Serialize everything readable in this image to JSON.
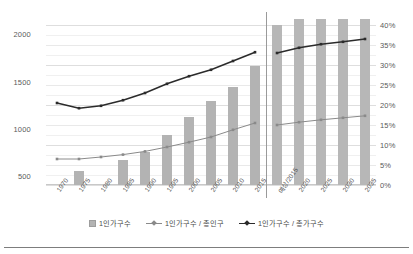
{
  "chart_data": {
    "type": "bar",
    "title": "",
    "subtitle": "",
    "xlabel": "",
    "ylabel": "",
    "y2label": "",
    "grid": true,
    "legend_position": "bottom",
    "panels": [
      {
        "name": "historical",
        "categories": [
          "1970",
          "1975",
          "1980",
          "1985",
          "1990",
          "1995",
          "2000",
          "2005",
          "2010",
          "2015"
        ],
        "series": [
          {
            "name": "1인가구수",
            "type": "bar",
            "axis": "left",
            "values": [
              null,
              548,
              383,
              661,
              750,
              930,
              1120,
              1290,
              1440,
              1670
            ],
            "color": "#b3b3b3"
          },
          {
            "name": "1인가구수 / 총인구",
            "type": "line",
            "axis": "right",
            "values": [
              6.5,
              6.5,
              7.0,
              7.6,
              8.4,
              9.5,
              10.7,
              12.0,
              13.8,
              15.5
            ],
            "color": "#8a8a8a"
          },
          {
            "name": "1인가구수 / 총가구수",
            "type": "line",
            "axis": "right",
            "values": [
              20.5,
              19.2,
              19.8,
              21.2,
              23.0,
              25.3,
              27.2,
              28.8,
              31.0,
              33.2
            ],
            "color": "#2b2b2b"
          }
        ]
      },
      {
        "name": "projection",
        "categories": [
          "예상/2015",
          "2020",
          "2025",
          "2030",
          "2035"
        ],
        "series": [
          {
            "name": "1인가구수",
            "type": "bar",
            "axis": "left",
            "values": [
              2100,
              2200,
              2280,
              2340,
              2400
            ],
            "color": "#b7b7b7"
          },
          {
            "name": "1인가구수 / 총인구",
            "type": "line",
            "axis": "right",
            "values": [
              15.0,
              15.7,
              16.3,
              16.8,
              17.3
            ],
            "color": "#8a8a8a"
          },
          {
            "name": "1인가구수 / 총가구수",
            "type": "line",
            "axis": "right",
            "values": [
              33.0,
              34.3,
              35.2,
              35.8,
              36.5
            ],
            "color": "#2b2b2b"
          }
        ]
      }
    ],
    "y_left": {
      "ticks": [
        "500",
        "1000",
        "1500",
        "2000"
      ],
      "tick_values": [
        500,
        1000,
        1500,
        2000
      ],
      "min": 400,
      "max": 2100
    },
    "y_right": {
      "ticks": [
        "0%",
        "5%",
        "10%",
        "15%",
        "20%",
        "25%",
        "30%",
        "35%",
        "40%"
      ],
      "tick_values": [
        0,
        5,
        10,
        15,
        20,
        25,
        30,
        35,
        40
      ],
      "min": 0,
      "max": 40
    },
    "legend": [
      {
        "label": "1인가구수",
        "marker": "bar-swatch",
        "color": "#b3b3b3"
      },
      {
        "label": "1인가구수 / 총인구",
        "marker": "line-swatch",
        "color": "#8a8a8a"
      },
      {
        "label": "1인가구수 / 총가구수",
        "marker": "line-swatch",
        "color": "#2b2b2b"
      }
    ]
  }
}
